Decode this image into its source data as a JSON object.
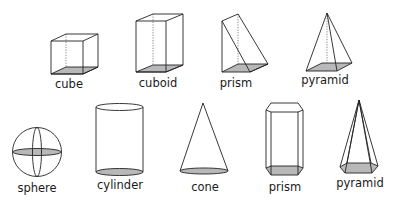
{
  "diagram": {
    "title": "",
    "colors": {
      "background": "#ffffff",
      "outline": "#222222",
      "shaded_base": "#b8b8b8"
    },
    "rows": [
      {
        "shapes": [
          {
            "id": "cube",
            "label": "cube"
          },
          {
            "id": "cuboid",
            "label": "cuboid"
          },
          {
            "id": "triangular-prism",
            "label": "prism"
          },
          {
            "id": "square-pyramid",
            "label": "pyramid"
          }
        ]
      },
      {
        "shapes": [
          {
            "id": "sphere",
            "label": "sphere"
          },
          {
            "id": "cylinder",
            "label": "cylinder"
          },
          {
            "id": "cone",
            "label": "cone"
          },
          {
            "id": "hexagonal-prism",
            "label": "prism"
          },
          {
            "id": "pentagonal-pyramid",
            "label": "pyramid"
          }
        ]
      }
    ]
  }
}
